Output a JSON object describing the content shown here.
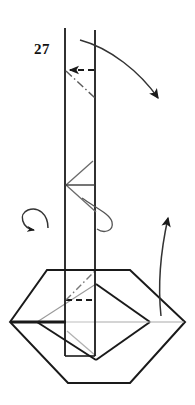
{
  "figure": {
    "kind": "origami-folding-diagram",
    "step_number": "27",
    "background_color": "#ffffff",
    "ink_color": "#1a1a1a",
    "faint_ink_color": "#8e8e8e",
    "canvas": {
      "width": 195,
      "height": 405
    },
    "labels": [
      {
        "name": "step-number-label",
        "text": "27",
        "x": 38,
        "y": 51
      }
    ],
    "parts": {
      "vertical_column": {
        "name": "vertical-column",
        "description": "tall narrow upright paper column",
        "left_x": 65,
        "right_x": 95,
        "top_y": 28,
        "bottom_y": 356
      },
      "hexagon_base": {
        "name": "hexagon-base",
        "description": "flat hexagonal base seen in perspective",
        "points": "10,322 47,270 130,270 185,322 130,383 68,383"
      },
      "inner_diamond": {
        "name": "inner-diamond",
        "description": "inner diamond / square folded flap on the base",
        "points": "37,322 96,284 150,322 96,360"
      }
    },
    "annotations": {
      "valley_fold_dashed": {
        "name": "valley-fold-dashed-line",
        "description": "horizontal dashed crease near the top of the column"
      },
      "mountain_dashdot": {
        "name": "mountain-fold-dash-dot-line",
        "description": "diagonal dash-dot crease below the top dashed crease"
      },
      "zigzag_crease": {
        "name": "zigzag-crease",
        "description": "Z-shaped crease lines in the middle of the column"
      },
      "arrows": [
        {
          "name": "fold-over-arrow-top-right",
          "type": "curved-solid-arrow",
          "direction": "down-right",
          "description": "large curved arrow sweeping from the top of the column down to the right"
        },
        {
          "name": "rotate-arrow-left",
          "type": "rotation-ellipse-arrow",
          "direction": "counterclockwise",
          "description": "elliptical rotation arrow at the left of the column"
        },
        {
          "name": "rotate-arrow-right",
          "type": "rotation-ellipse-arrow",
          "direction": "around-column",
          "description": "small elliptical rotation loop around the right edge of the column"
        },
        {
          "name": "fold-up-arrow-right",
          "type": "curved-solid-arrow",
          "direction": "up",
          "description": "long curved arrow rising from the base edge upward on the right"
        }
      ]
    }
  }
}
